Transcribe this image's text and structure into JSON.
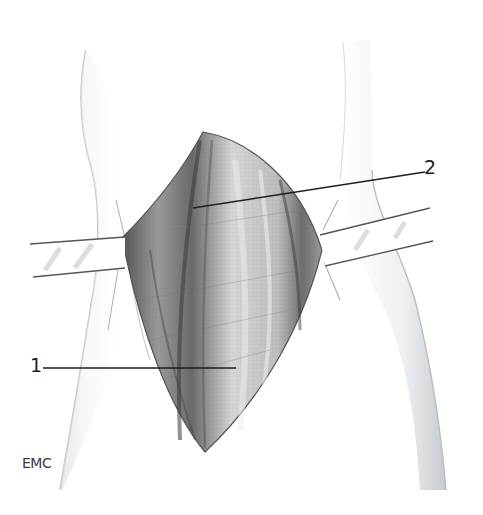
{
  "figure": {
    "kind": "anatomical illustration",
    "labels": [
      {
        "id": "1",
        "text": "1",
        "x": 30,
        "y": 358,
        "line": [
          43,
          368,
          236,
          368
        ]
      },
      {
        "id": "2",
        "text": "2",
        "x": 424,
        "y": 160,
        "line": [
          193,
          208,
          425,
          172
        ]
      }
    ],
    "watermark": "EMC",
    "colors": {
      "background": "#ffffff",
      "tissue_dark": "#3c3c3c",
      "tissue_mid": "#8a8a8a",
      "tissue_light": "#d8d8d8",
      "limb_shade": "#cfd4d8",
      "line": "#222222"
    }
  }
}
